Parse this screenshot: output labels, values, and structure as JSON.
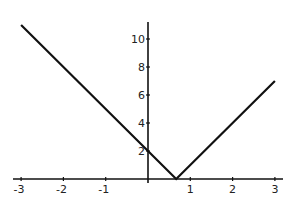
{
  "chart_data": {
    "type": "line",
    "title": "",
    "xlabel": "",
    "ylabel": "",
    "function": "|3x - 2|",
    "x": [
      -3,
      0.6667,
      3
    ],
    "series": [
      {
        "name": "y = |3x - 2|",
        "values": [
          11,
          0,
          7
        ],
        "color": "#111111"
      }
    ],
    "xlim": [
      -3,
      3
    ],
    "ylim": [
      0,
      11
    ],
    "x_ticks": [
      -3,
      -2,
      -1,
      1,
      2,
      3
    ],
    "x_tick_labels": [
      "-3",
      "-2",
      "-1",
      "1",
      "2",
      "3"
    ],
    "y_ticks": [
      2,
      4,
      6,
      8,
      10
    ],
    "y_tick_labels": [
      "2",
      "4",
      "6",
      "8",
      "10"
    ],
    "grid": false,
    "legend": null
  }
}
